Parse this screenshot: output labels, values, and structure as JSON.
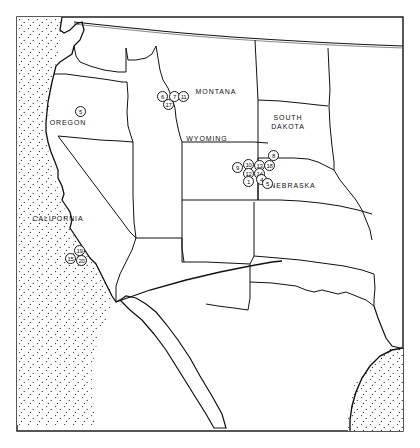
{
  "figure": {
    "frame_color": "#111111",
    "land_color": "#ffffff",
    "ocean_fill": "stipple",
    "ocean_color": "#111111"
  },
  "state_labels": [
    {
      "name": "OREGON",
      "text": "OREGON",
      "x": 68,
      "y": 123
    },
    {
      "name": "CALIFORNIA",
      "text": "CALIFORNIA",
      "x": 58,
      "y": 219
    },
    {
      "name": "MONTANA",
      "text": "MONTANA",
      "x": 216,
      "y": 92
    },
    {
      "name": "WYOMING",
      "text": "WYOMING",
      "x": 207,
      "y": 139
    },
    {
      "name": "SOUTH DAKOTA",
      "text": "SOUTH\nDAKOTA",
      "x": 288,
      "y": 122
    },
    {
      "name": "NEBRASKA",
      "text": "NEBRASKA",
      "x": 293,
      "y": 186
    }
  ],
  "markers": [
    {
      "id": "5",
      "label": "5",
      "x": 75,
      "y": 106,
      "cluster": "oregon"
    },
    {
      "id": "6",
      "label": "6",
      "x": 157,
      "y": 91,
      "cluster": "idaho"
    },
    {
      "id": "7",
      "label": "7",
      "x": 169,
      "y": 91,
      "cluster": "idaho"
    },
    {
      "id": "11",
      "label": "11",
      "x": 178,
      "y": 91,
      "cluster": "idaho"
    },
    {
      "id": "17",
      "label": "17",
      "x": 163,
      "y": 99,
      "cluster": "idaho"
    },
    {
      "id": "8t",
      "label": "8",
      "x": 268,
      "y": 150,
      "cluster": "nebraska"
    },
    {
      "id": "9",
      "label": "9",
      "x": 232,
      "y": 162,
      "cluster": "nebraska"
    },
    {
      "id": "10",
      "label": "10",
      "x": 243,
      "y": 159,
      "cluster": "nebraska"
    },
    {
      "id": "13",
      "label": "13",
      "x": 254,
      "y": 160,
      "cluster": "nebraska"
    },
    {
      "id": "18",
      "label": "18",
      "x": 264,
      "y": 160,
      "cluster": "nebraska"
    },
    {
      "id": "12",
      "label": "12",
      "x": 243,
      "y": 168,
      "cluster": "nebraska"
    },
    {
      "id": "14",
      "label": "14",
      "x": 254,
      "y": 168,
      "cluster": "nebraska"
    },
    {
      "id": "1",
      "label": "1",
      "x": 243,
      "y": 176,
      "cluster": "nebraska"
    },
    {
      "id": "4",
      "label": "4",
      "x": 256,
      "y": 174,
      "cluster": "nebraska"
    },
    {
      "id": "5b",
      "label": "5",
      "x": 262,
      "y": 178,
      "cluster": "nebraska"
    },
    {
      "id": "19",
      "label": "19",
      "x": 74,
      "y": 245,
      "cluster": "california"
    },
    {
      "id": "15",
      "label": "15",
      "x": 65,
      "y": 253,
      "cluster": "california"
    },
    {
      "id": "20",
      "label": "20",
      "x": 76,
      "y": 255,
      "cluster": "california"
    }
  ]
}
